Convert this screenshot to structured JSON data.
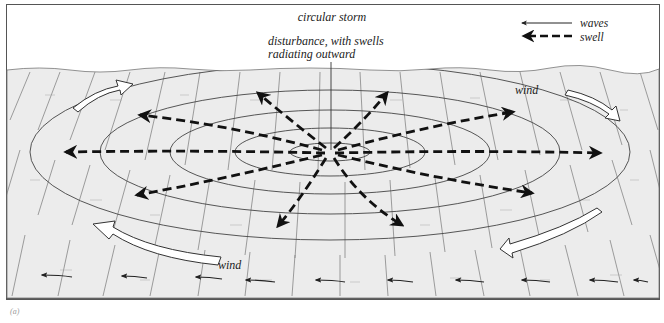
{
  "figure": {
    "title": "circular storm",
    "center_annotation": [
      "disturbance, with swells",
      "radiating outward"
    ],
    "caption_marker": "(a)"
  },
  "legend": {
    "items": [
      {
        "symbol": "thin-solid-arrow",
        "label": "waves"
      },
      {
        "symbol": "thick-dashed-arrow",
        "label": "swell"
      }
    ]
  },
  "labels": {
    "wind_upper_right": "wind",
    "wind_lower_left": "wind"
  },
  "colors": {
    "ocean": "#ececec",
    "ink": "#1a1a1a",
    "grid": "#6a6a6a",
    "background": "#ffffff"
  },
  "diagram": {
    "center": [
      330,
      152
    ],
    "swell_arrow_count": 10,
    "concentric_ellipses": 5,
    "wind_arrows": [
      "upper-left curving right",
      "upper-right curving down",
      "lower-right curving left",
      "lower-left curving up"
    ],
    "wave_arrows_row_count": 11
  }
}
